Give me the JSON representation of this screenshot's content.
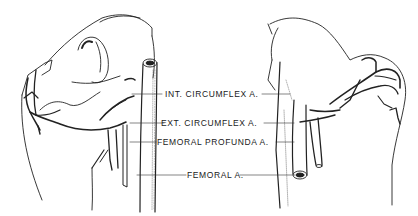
{
  "figure": {
    "type": "anatomical-illustration",
    "views": [
      "left-femur-head-anterior",
      "right-femur-head-posterior"
    ],
    "labels": [
      {
        "id": "int-circumflex",
        "text": "INT. CIRCUMFLEX A."
      },
      {
        "id": "ext-circumflex",
        "text": "EXT. CIRCUMFLEX A."
      },
      {
        "id": "femoral-profunda",
        "text": "FEMORAL PROFUNDA A."
      },
      {
        "id": "femoral",
        "text": "FEMORAL A."
      }
    ]
  }
}
